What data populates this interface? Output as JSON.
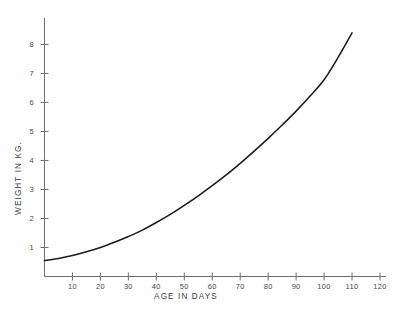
{
  "chart_data": {
    "type": "line",
    "title": "",
    "xlabel": "AGE IN DAYS",
    "ylabel": "WEIGHT IN KG.",
    "xlim": [
      0,
      120
    ],
    "ylim": [
      0,
      8.6
    ],
    "grid": false,
    "legend": null,
    "xticks": [
      10,
      20,
      30,
      40,
      50,
      60,
      70,
      80,
      90,
      100,
      110,
      120
    ],
    "xtick_labels": [
      "10",
      "20",
      "30",
      "40",
      "50",
      "60",
      "70",
      "80",
      "90",
      "100",
      "110",
      "120"
    ],
    "yticks": [
      1,
      2,
      3,
      4,
      5,
      6,
      7,
      8
    ],
    "ytick_labels": [
      "1",
      "2",
      "3",
      "4",
      "5",
      "6",
      "7",
      "8"
    ],
    "series": [
      {
        "name": "weight",
        "color": "#1c1c1c",
        "x": [
          0,
          5,
          10,
          15,
          20,
          25,
          30,
          35,
          40,
          45,
          50,
          55,
          60,
          65,
          70,
          75,
          80,
          85,
          90,
          95,
          100,
          105,
          110
        ],
        "values": [
          0.55,
          0.62,
          0.72,
          0.85,
          1.0,
          1.18,
          1.38,
          1.6,
          1.86,
          2.14,
          2.45,
          2.78,
          3.13,
          3.5,
          3.9,
          4.32,
          4.76,
          5.22,
          5.7,
          6.22,
          6.78,
          7.55,
          8.4
        ]
      }
    ]
  },
  "axes": {
    "y_label": "WEIGHT IN KG.",
    "x_label": "AGE IN DAYS"
  },
  "colors": {
    "curve": "#1c1c1c",
    "axis": "#6e6e6e",
    "text": "#4a4a4a",
    "background": "#fefefe"
  }
}
